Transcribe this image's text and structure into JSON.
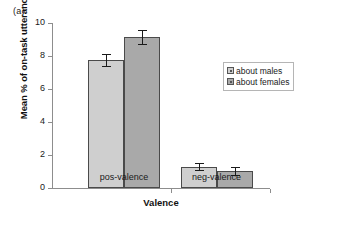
{
  "panel_label": "(a)",
  "legend": {
    "items": [
      {
        "label": "about males",
        "color": "#cfcfcf"
      },
      {
        "label": "about females",
        "color": "#a9a9a9"
      }
    ]
  },
  "axes": {
    "y_ticks": [
      "0",
      "2",
      "4",
      "6",
      "8",
      "10"
    ],
    "x_groups": [
      "pos-valence",
      "neg-valence"
    ]
  },
  "chart_data": {
    "type": "bar",
    "title": "(a)",
    "xlabel": "Valence",
    "ylabel": "Mean % of on-task utterances",
    "categories": [
      "pos-valence",
      "neg-valence"
    ],
    "ylim": [
      0,
      10
    ],
    "ytick_step": 2,
    "grid": false,
    "legend_position": "right",
    "error_bars": "symmetric",
    "series": [
      {
        "name": "about males",
        "color": "#cfcfcf",
        "values": [
          7.75,
          1.3
        ],
        "errors": [
          0.35,
          0.2
        ]
      },
      {
        "name": "about females",
        "color": "#a9a9a9",
        "values": [
          9.15,
          1.05
        ],
        "errors": [
          0.4,
          0.25
        ]
      }
    ]
  }
}
